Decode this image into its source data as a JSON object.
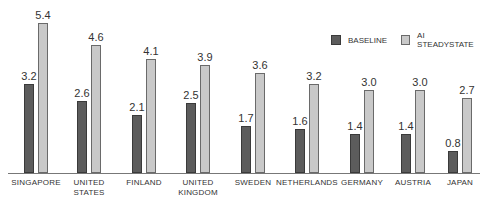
{
  "chart_data": {
    "type": "bar",
    "title": "",
    "xlabel": "",
    "ylabel": "",
    "ylim": [
      0,
      5.4
    ],
    "grid": false,
    "legend_position": "top-right",
    "categories": [
      "SINGAPORE",
      "UNITED STATES",
      "FINLAND",
      "UNITED KINGDOM",
      "SWEDEN",
      "NETHERLANDS",
      "GERMANY",
      "AUSTRIA",
      "JAPAN"
    ],
    "category_lines": [
      [
        "SINGAPORE"
      ],
      [
        "UNITED",
        "STATES"
      ],
      [
        "FINLAND"
      ],
      [
        "UNITED",
        "KINGDOM"
      ],
      [
        "SWEDEN"
      ],
      [
        "NETHERLANDS"
      ],
      [
        "GERMANY"
      ],
      [
        "AUSTRIA"
      ],
      [
        "JAPAN"
      ]
    ],
    "series": [
      {
        "name": "BASELINE",
        "color": "#5c5c5c",
        "values": [
          3.2,
          2.6,
          2.1,
          2.5,
          1.7,
          1.6,
          1.4,
          1.4,
          0.8
        ],
        "labels": [
          "3.2",
          "2.6",
          "2.1",
          "2.5",
          "1.7",
          "1.6",
          "1.4",
          "1.4",
          "0.8"
        ]
      },
      {
        "name": "AI STEADYSTATE",
        "color": "#c9c9c9",
        "values": [
          5.4,
          4.6,
          4.1,
          3.9,
          3.6,
          3.2,
          3.0,
          3.0,
          2.7
        ],
        "labels": [
          "5.4",
          "4.6",
          "4.1",
          "3.9",
          "3.6",
          "3.2",
          "3.0",
          "3.0",
          "2.7"
        ]
      }
    ]
  },
  "legend": {
    "items": [
      {
        "label": "BASELINE"
      },
      {
        "label": "AI STEADYSTATE"
      }
    ]
  },
  "layout": {
    "group_centers": [
      36,
      89,
      144,
      198,
      253,
      307,
      362,
      413,
      460
    ],
    "axis_y": 173,
    "px_per_unit": 27.8
  }
}
